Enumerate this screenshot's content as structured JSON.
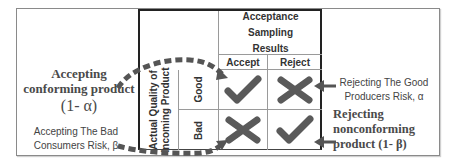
{
  "table": {
    "header": [
      "Acceptance Sampling",
      "Results"
    ],
    "columns": [
      "Accept",
      "Reject"
    ],
    "row_group_label": [
      "Actual Quality of",
      "Incoming Product"
    ],
    "rows": [
      {
        "label": "Good",
        "cells": [
          {
            "icon": "check-icon"
          },
          {
            "icon": "cross-icon"
          }
        ]
      },
      {
        "label": "Bad",
        "cells": [
          {
            "icon": "cross-icon"
          },
          {
            "icon": "check-icon"
          }
        ]
      }
    ]
  },
  "annotations": {
    "accept_conforming": {
      "line1": "Accepting",
      "line2": "conforming product",
      "formula": "(1- α)"
    },
    "consumers_risk": {
      "line1": "Accepting The Bad",
      "line2": "Consumers Risk, β"
    },
    "producers_risk": {
      "line1": "Rejecting The Good",
      "line2": "Producers Risk, α"
    },
    "reject_nonconforming": {
      "line1": "Rejecting",
      "line2": "nonconforming",
      "line3": "product (1- β)"
    }
  },
  "colors": {
    "icon": "#5a5a5a",
    "border": "#222222",
    "gridline": "#9a9a9a",
    "text": "#4a4a4a",
    "dashed_arrow": "#555555"
  }
}
